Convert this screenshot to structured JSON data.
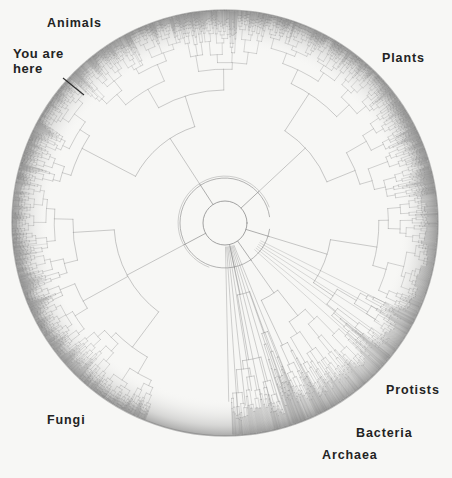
{
  "figure": {
    "type": "circular-phylogenetic-tree",
    "title_visible": false,
    "background_color": "#f7f7f5",
    "ink_color": "#6e6e6e",
    "label_color": "#232323",
    "circle": {
      "cx": 225,
      "cy": 223,
      "outer_radius": 213,
      "inner_radius": 22
    }
  },
  "labels": {
    "animals": "Animals",
    "you_are_here_line1": "You are",
    "you_are_here_line2": "here",
    "plants": "Plants",
    "protists": "Protists",
    "bacteria": "Bacteria",
    "archaea": "Archaea",
    "fungi": "Fungi"
  },
  "chart_data": {
    "type": "tree",
    "title": "",
    "xlabel": "",
    "ylabel": "",
    "layout": "radial/circular dendrogram, root at center, tips on outer rim",
    "grid": false,
    "legend_position": "none",
    "annotations": [
      {
        "text": "Animals",
        "x": 47,
        "y": 17,
        "angle_deg": 112,
        "region": "upper-left"
      },
      {
        "text": "You are here",
        "x": 13,
        "y": 47,
        "angle_deg": 140,
        "region": "left-upper",
        "leader_line": {
          "x1": 63,
          "y1": 78,
          "x2": 84,
          "y2": 95
        }
      },
      {
        "text": "Plants",
        "x": 382,
        "y": 52,
        "angle_deg": 45,
        "region": "upper-right"
      },
      {
        "text": "Protists",
        "x": 386,
        "y": 384,
        "angle_deg": 322,
        "region": "lower-right"
      },
      {
        "text": "Bacteria",
        "x": 356,
        "y": 427,
        "angle_deg": 305,
        "region": "lower-right"
      },
      {
        "text": "Archaea",
        "x": 322,
        "y": 449,
        "angle_deg": 295,
        "region": "bottom-right"
      },
      {
        "text": "Fungi",
        "x": 47,
        "y": 414,
        "angle_deg": 215,
        "region": "lower-left"
      }
    ],
    "clades": [
      {
        "name": "Animals",
        "start_angle_deg": 78,
        "end_angle_deg": 168,
        "tip_density": "very-high"
      },
      {
        "name": "Fungi",
        "start_angle_deg": 168,
        "end_angle_deg": 248,
        "tip_density": "high"
      },
      {
        "name": "Plants",
        "start_angle_deg": 8,
        "end_angle_deg": 78,
        "tip_density": "very-high"
      },
      {
        "name": "Protists",
        "start_angle_deg": 318,
        "end_angle_deg": 8,
        "tip_density": "medium"
      },
      {
        "name": "Bacteria",
        "start_angle_deg": 292,
        "end_angle_deg": 318,
        "tip_density": "medium"
      },
      {
        "name": "Archaea",
        "start_angle_deg": 272,
        "end_angle_deg": 292,
        "tip_density": "low"
      }
    ]
  }
}
